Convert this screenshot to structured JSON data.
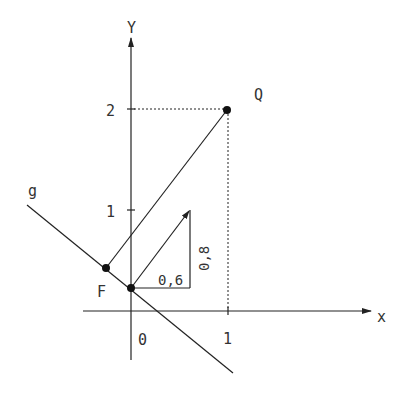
{
  "colors": {
    "ink": "#222222",
    "text": "#333333",
    "background": "#ffffff"
  },
  "axes": {
    "x_label": "x",
    "y_label": "Y",
    "origin_label": "0",
    "x_tick_labels": [
      "1"
    ],
    "y_tick_labels": [
      "1",
      "2"
    ]
  },
  "points": {
    "F": {
      "label": "F"
    },
    "Q": {
      "label": "Q",
      "coords": [
        1,
        2
      ]
    },
    "P": {
      "label": ""
    }
  },
  "line_g": {
    "label": "g"
  },
  "direction_vector": {
    "dx_label": "0,6",
    "dy_label": "0,8"
  }
}
